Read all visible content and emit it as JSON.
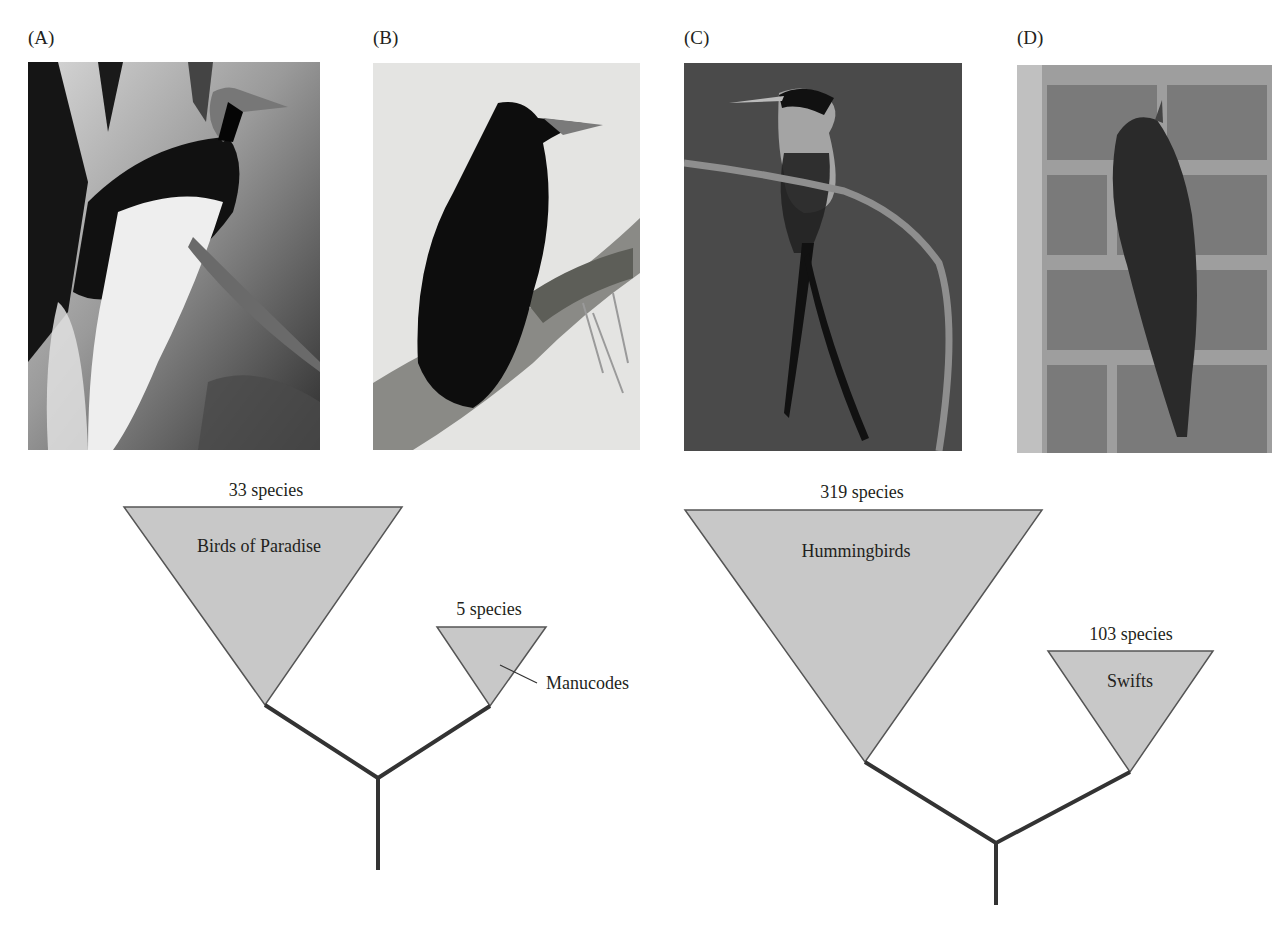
{
  "panels": [
    {
      "label": "(A)",
      "subject": "bird-of-paradise-photo"
    },
    {
      "label": "(B)",
      "subject": "manucode-photo"
    },
    {
      "label": "(C)",
      "subject": "hummingbird-photo"
    },
    {
      "label": "(D)",
      "subject": "swift-photo"
    }
  ],
  "trees": [
    {
      "name": "left-tree",
      "clades": [
        {
          "name": "Birds of Paradise",
          "count_label": "33 species",
          "species": 33
        },
        {
          "name": "Manucodes",
          "count_label": "5 species",
          "species": 5
        }
      ]
    },
    {
      "name": "right-tree",
      "clades": [
        {
          "name": "Hummingbirds",
          "count_label": "319 species",
          "species": 319
        },
        {
          "name": "Swifts",
          "count_label": "103 species",
          "species": 103
        }
      ]
    }
  ],
  "colors": {
    "triangle_fill": "#c8c8c8",
    "triangle_stroke": "#555555",
    "branch": "#333333",
    "text": "#231f20"
  }
}
